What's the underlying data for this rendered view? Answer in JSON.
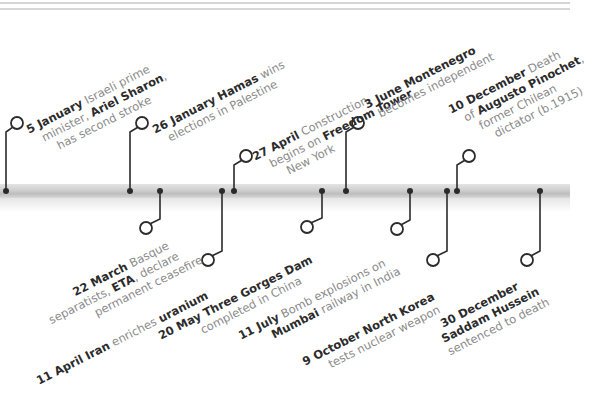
{
  "colors": {
    "line": "#2b2b2b",
    "bold_text": "#2b2b2b",
    "text": "#8a8a8a",
    "bar": "#cfcfcf",
    "rule": "#d6d6d6",
    "background": "#ffffff"
  },
  "timeline": {
    "bar_y": 191,
    "events": [
      {
        "id": "jan5",
        "position": "above",
        "dot_x": 6,
        "circle": [
          17,
          123
        ],
        "date": "5 January",
        "lines": [
          [
            {
              "t": "5 January",
              "b": true
            },
            {
              "t": " Israeli prime",
              "b": false
            }
          ],
          [
            {
              "t": "minister, ",
              "b": false
            },
            {
              "t": "Ariel Sharon",
              "b": true
            },
            {
              "t": ",",
              "b": false
            }
          ],
          [
            {
              "t": "has second stroke",
              "b": false
            }
          ]
        ]
      },
      {
        "id": "jan26",
        "position": "above",
        "dot_x": 130,
        "circle": [
          142,
          123
        ],
        "date": "26 January",
        "lines": [
          [
            {
              "t": "26 January",
              "b": true
            },
            {
              "t": " ",
              "b": false
            },
            {
              "t": "Hamas",
              "b": true
            },
            {
              "t": " wins",
              "b": false
            }
          ],
          [
            {
              "t": "elections in Palestine",
              "b": false
            }
          ]
        ]
      },
      {
        "id": "apr27",
        "position": "above",
        "dot_x": 234,
        "circle": [
          246,
          156
        ],
        "date": "27 April",
        "lines": [
          [
            {
              "t": "27 April",
              "b": true
            },
            {
              "t": " Construction",
              "b": false
            }
          ],
          [
            {
              "t": "begins on ",
              "b": false
            },
            {
              "t": "Freedom Tower",
              "b": true
            },
            {
              "t": ",",
              "b": false
            }
          ],
          [
            {
              "t": "New York",
              "b": false
            }
          ]
        ]
      },
      {
        "id": "jun3",
        "position": "above",
        "dot_x": 346,
        "circle": [
          358,
          123
        ],
        "date": "3 June",
        "lines": [
          [
            {
              "t": "3 June Montenegro",
              "b": true
            }
          ],
          [
            {
              "t": "becomes independent",
              "b": false
            }
          ]
        ]
      },
      {
        "id": "dec10",
        "position": "above",
        "dot_x": 457,
        "circle": [
          469,
          156
        ],
        "date": "10 December",
        "lines": [
          [
            {
              "t": "10 December",
              "b": true
            },
            {
              "t": " Death",
              "b": false
            }
          ],
          [
            {
              "t": "of ",
              "b": false
            },
            {
              "t": "Augusto Pinochet",
              "b": true
            },
            {
              "t": ",",
              "b": false
            }
          ],
          [
            {
              "t": "former Chilean",
              "b": false
            }
          ],
          [
            {
              "t": "dictator (b.1915)",
              "b": false
            }
          ]
        ]
      },
      {
        "id": "mar22",
        "position": "below",
        "dot_x": 160,
        "circle": [
          146,
          228
        ],
        "date": "22 March",
        "lines": [
          [
            {
              "t": "22 March",
              "b": true
            },
            {
              "t": " Basque",
              "b": false
            }
          ],
          [
            {
              "t": "separatists, ",
              "b": false
            },
            {
              "t": "ETA",
              "b": true
            },
            {
              "t": ", declare",
              "b": false
            }
          ],
          [
            {
              "t": "permanent ceasefire",
              "b": false
            }
          ]
        ]
      },
      {
        "id": "apr11",
        "position": "below",
        "dot_x": 222,
        "circle": [
          208,
          260
        ],
        "date": "11 April",
        "lines": [
          [
            {
              "t": "11 April Iran",
              "b": true
            },
            {
              "t": " enriches ",
              "b": false
            },
            {
              "t": "uranium",
              "b": true
            }
          ]
        ]
      },
      {
        "id": "may20",
        "position": "below",
        "dot_x": 322,
        "circle": [
          307,
          227
        ],
        "date": "20 May",
        "lines": [
          [
            {
              "t": "20 May Three Gorges Dam",
              "b": true
            }
          ],
          [
            {
              "t": "completed in China",
              "b": false
            }
          ]
        ]
      },
      {
        "id": "jul11",
        "position": "below",
        "dot_x": 410,
        "circle": [
          397,
          229
        ],
        "date": "11 July",
        "lines": [
          [
            {
              "t": "11 July",
              "b": true
            },
            {
              "t": " Bomb explosions on",
              "b": false
            }
          ],
          [
            {
              "t": "Mumbai",
              "b": true
            },
            {
              "t": " railway in India",
              "b": false
            }
          ]
        ]
      },
      {
        "id": "oct9",
        "position": "below",
        "dot_x": 447,
        "circle": [
          433,
          260
        ],
        "date": "9 October",
        "lines": [
          [
            {
              "t": "9 October North Korea",
              "b": true
            }
          ],
          [
            {
              "t": "tests nuclear weapon",
              "b": false
            }
          ]
        ]
      },
      {
        "id": "dec30",
        "position": "below",
        "dot_x": 540,
        "circle": [
          527,
          260
        ],
        "date": "30 December",
        "lines": [
          [
            {
              "t": "30 December",
              "b": true
            }
          ],
          [
            {
              "t": "Saddam Hussein",
              "b": true
            }
          ],
          [
            {
              "t": "sentenced to death",
              "b": false
            }
          ]
        ]
      }
    ]
  },
  "label_positions": {
    "jan5": {
      "x": 24,
      "y": 124,
      "indent": [
        0,
        10,
        20
      ]
    },
    "jan26": {
      "x": 150,
      "y": 124,
      "indent": [
        0,
        10
      ]
    },
    "apr27": {
      "x": 250,
      "y": 151,
      "indent": [
        0,
        12,
        24
      ]
    },
    "jun3": {
      "x": 362,
      "y": 99,
      "indent": [
        0,
        8
      ]
    },
    "dec10": {
      "x": 446,
      "y": 104,
      "indent": [
        0,
        10,
        20,
        30
      ]
    },
    "mar22": {
      "x": 40,
      "y": 302,
      "indent": [
        34,
        0,
        44
      ]
    },
    "apr11": {
      "x": 34,
      "y": 375,
      "indent": [
        0
      ]
    },
    "may20": {
      "x": 156,
      "y": 330,
      "indent": [
        0,
        40
      ]
    },
    "jul11": {
      "x": 236,
      "y": 330,
      "indent": [
        0,
        30
      ]
    },
    "oct9": {
      "x": 300,
      "y": 356,
      "indent": [
        0,
        22
      ]
    },
    "dec30": {
      "x": 438,
      "y": 318,
      "indent": [
        0,
        -6,
        -6
      ]
    }
  }
}
